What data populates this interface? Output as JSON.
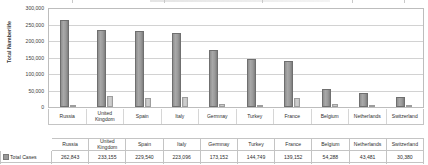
{
  "chart_data": {
    "type": "bar",
    "title": "",
    "xlabel": "",
    "ylabel": "Total Numberlife",
    "ylim": [
      0,
      300000
    ],
    "yticks": [
      "300,000",
      "250,000",
      "200,000",
      "150,000",
      "100,000",
      "50,000",
      "0"
    ],
    "ytick_values": [
      300000,
      250000,
      200000,
      150000,
      100000,
      50000,
      0
    ],
    "grid": true,
    "legend_position": "table-rows",
    "categories": [
      "Russia",
      "United Kingdom",
      "Spain",
      "Italy",
      "Germnay",
      "Turkey",
      "France",
      "Belgium",
      "Netherlands",
      "Switzerland"
    ],
    "series": [
      {
        "name": "Total Cases",
        "color": "#9a9a9a",
        "values": [
          262843,
          233155,
          229540,
          223096,
          173152,
          144749,
          139152,
          54288,
          43481,
          30380
        ],
        "labels": [
          "262,843",
          "233,155",
          "229,540",
          "223,096",
          "173,152",
          "144,749",
          "139,152",
          "54,288",
          "43,481",
          "30,380"
        ]
      },
      {
        "name": "Total Deaths",
        "color": "#cbcbcb",
        "values": [
          2418,
          33614,
          27321,
          31368,
          7824,
          4007,
          27378,
          8903,
          5590,
          1588
        ],
        "labels": [
          "2418",
          "33,614",
          "27,321",
          "31,368",
          "7824",
          "4007",
          "27,378",
          "8903",
          "5590",
          "1588"
        ]
      }
    ]
  },
  "table": {
    "rows": [
      {
        "label": "Total Cases",
        "swatch": "sw-cases"
      },
      {
        "label": "Total Deaths",
        "swatch": "sw-deaths"
      }
    ]
  }
}
